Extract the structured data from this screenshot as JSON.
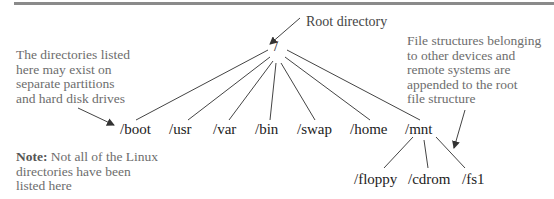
{
  "diagram": {
    "title_rule": true,
    "root": {
      "label": "/",
      "callout": "Root directory"
    },
    "children": [
      {
        "label": "/boot"
      },
      {
        "label": "/usr"
      },
      {
        "label": "/var"
      },
      {
        "label": "/bin"
      },
      {
        "label": "/swap"
      },
      {
        "label": "/home"
      },
      {
        "label": "/mnt",
        "children": [
          {
            "label": "/floppy"
          },
          {
            "label": "/cdrom"
          },
          {
            "label": "/fs1"
          }
        ]
      }
    ],
    "annotations": {
      "left_top": [
        "The directories listed",
        "here may exist on",
        "separate partitions",
        "and hard disk drives"
      ],
      "left_note_bold": "Note:",
      "left_note_rest": [
        "Not all of the Linux",
        "directories have been",
        "listed here"
      ],
      "right": [
        "File structures belonging",
        "to other devices and",
        "remote systems are",
        "appended to the root",
        "file structure"
      ]
    },
    "colors": {
      "rule": "#8a8a8a",
      "line": "#333333",
      "annotation_text": "#6d6d6d",
      "dir_text": "#222222"
    }
  }
}
